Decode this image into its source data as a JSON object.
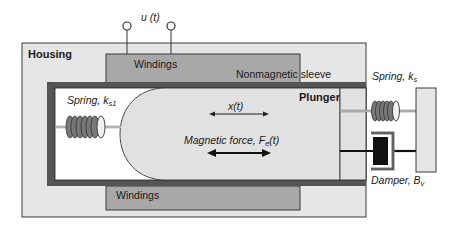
{
  "diagram": {
    "type": "solenoid-actuator-schematic",
    "input": {
      "label": "u (t)"
    },
    "housing": {
      "label": "Housing"
    },
    "windings_top": {
      "label": "Windings"
    },
    "windings_bottom": {
      "label": "Windings"
    },
    "sleeve": {
      "label": "Nonmagnetic sleeve"
    },
    "plunger": {
      "label": "Plunger"
    },
    "displacement": {
      "label": "x(t)"
    },
    "magnetic_force": {
      "label_main": "Magnetic force, F",
      "label_sub": "e",
      "label_tail": "(t)"
    },
    "spring_inner": {
      "label_main": "Spring, k",
      "label_sub": "s1"
    },
    "spring_outer": {
      "label_main": "Spring, k",
      "label_sub": "s"
    },
    "damper": {
      "label_main": "Damper, B",
      "label_sub": "v"
    },
    "colors": {
      "housing_fill": "#e6e6e6",
      "windings_fill": "#a8a8a8",
      "sleeve_border": "#555555",
      "plunger_fill": "#e1e1e1",
      "outline": "#3a3a3a",
      "damper_block": "#111111"
    }
  }
}
